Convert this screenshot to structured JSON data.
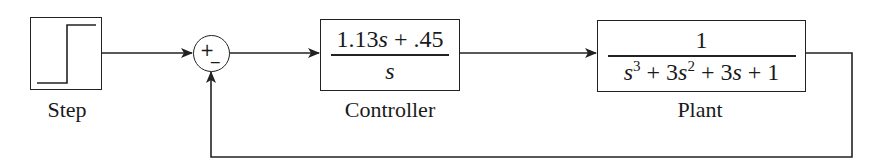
{
  "diagram": {
    "type": "closed-loop block diagram",
    "blocks": {
      "step": {
        "label": "Step"
      },
      "controller": {
        "label": "Controller",
        "numerator": {
          "c1": "1.13",
          "v1": "s",
          "rest": " + .45"
        },
        "denominator": {
          "v": "s"
        }
      },
      "plant": {
        "label": "Plant",
        "numerator": "1",
        "denominator": {
          "t1": "s",
          "e1": "3",
          "t2a": " + 3",
          "t2v": "s",
          "e2": "2",
          "t3a": " + 3",
          "t3v": "s",
          "t4": " + 1"
        }
      }
    },
    "sum_junction": {
      "plus": "+",
      "minus": "_"
    },
    "connections": [
      {
        "from": "step",
        "to": "sum_junction"
      },
      {
        "from": "sum_junction",
        "to": "controller"
      },
      {
        "from": "controller",
        "to": "plant"
      },
      {
        "from": "plant",
        "to": "sum_junction",
        "type": "negative feedback"
      }
    ],
    "colors": {
      "line": "#222222",
      "background": "#ffffff"
    }
  }
}
